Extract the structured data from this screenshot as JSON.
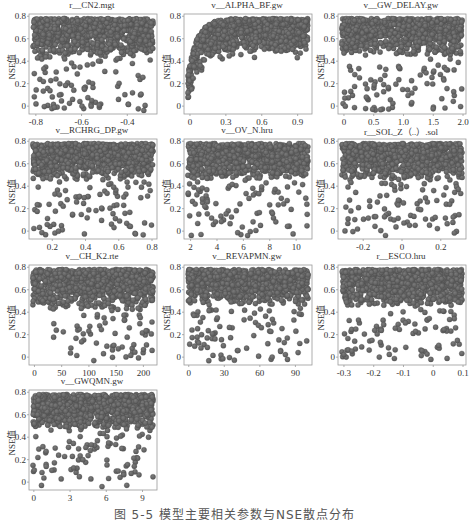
{
  "figure": {
    "caption": "图 5-5   模型主要相关参数与NSE散点分布",
    "ylabel": "NSE值",
    "dot_color": "#5a5a5a",
    "frame_color": "#9a9a9a",
    "text_color": "#333333"
  },
  "chart_data": [
    {
      "type": "scatter",
      "title": "r__CN2.mgt",
      "xlabel": "",
      "ylabel": "NSE值",
      "xlim": [
        -0.83,
        -0.27
      ],
      "ylim": [
        -0.07,
        0.82
      ],
      "xticks": [
        -0.8,
        -0.6,
        -0.4
      ],
      "xtick_labels": [
        "-0.8",
        "-0.6",
        "-0.4"
      ],
      "yticks": [
        0,
        0.2,
        0.4,
        0.6,
        0.8
      ],
      "ytick_labels": [
        "0",
        "0.2",
        "0.4",
        "0.6",
        "0.8"
      ],
      "pattern": "uniform",
      "dense_band": [
        0.42,
        0.78
      ]
    },
    {
      "type": "scatter",
      "title": "v__ALPHA_BF.gw",
      "xlabel": "",
      "ylabel": "NSE值",
      "xlim": [
        -0.05,
        1.02
      ],
      "ylim": [
        -0.07,
        0.82
      ],
      "xticks": [
        0,
        0.3,
        0.6,
        0.9
      ],
      "xtick_labels": [
        "0",
        "0.3",
        "0.6",
        "0.9"
      ],
      "yticks": [
        0,
        0.2,
        0.4,
        0.6,
        0.8
      ],
      "ytick_labels": [
        "0",
        "0.2",
        "0.4",
        "0.6",
        "0.8"
      ],
      "pattern": "saturating",
      "dense_band": [
        0.5,
        0.78
      ]
    },
    {
      "type": "scatter",
      "title": "v__GW_DELAY.gw",
      "xlabel": "",
      "ylabel": "NSE值",
      "xlim": [
        -0.1,
        2.05
      ],
      "ylim": [
        -0.07,
        0.82
      ],
      "xticks": [
        0,
        0.5,
        1.0,
        1.5,
        2.0
      ],
      "xtick_labels": [
        "0",
        "0.5",
        "1.0",
        "1.5",
        "2.0"
      ],
      "yticks": [
        0,
        0.2,
        0.4,
        0.6,
        0.8
      ],
      "ytick_labels": [
        "0",
        "0.2",
        "0.4",
        "0.6",
        "0.8"
      ],
      "pattern": "uniform",
      "dense_band": [
        0.45,
        0.78
      ]
    },
    {
      "type": "scatter",
      "title": "v__RCHRG_DP.gw",
      "xlabel": "",
      "ylabel": "NSE值",
      "xlim": [
        0.06,
        0.83
      ],
      "ylim": [
        -0.07,
        0.82
      ],
      "xticks": [
        0.2,
        0.4,
        0.6,
        0.8
      ],
      "xtick_labels": [
        "0.2",
        "0.4",
        "0.6",
        "0.8"
      ],
      "yticks": [
        0,
        0.2,
        0.4,
        0.6,
        0.8
      ],
      "ytick_labels": [
        "0",
        "0.2",
        "0.4",
        "0.6",
        "0.8"
      ],
      "pattern": "uniform",
      "dense_band": [
        0.45,
        0.78
      ]
    },
    {
      "type": "scatter",
      "title": "v__OV_N.hru",
      "xlabel": "",
      "ylabel": "NSE值",
      "xlim": [
        1.5,
        11.2
      ],
      "ylim": [
        -0.07,
        0.82
      ],
      "xticks": [
        2,
        4,
        6,
        8,
        10
      ],
      "xtick_labels": [
        "2",
        "4",
        "6",
        "8",
        "10"
      ],
      "yticks": [
        0,
        0.2,
        0.4,
        0.6,
        0.8
      ],
      "ytick_labels": [
        "0",
        "0.2",
        "0.4",
        "0.6",
        "0.8"
      ],
      "pattern": "uniform",
      "dense_band": [
        0.45,
        0.78
      ]
    },
    {
      "type": "scatter",
      "title": "r__SOL_Z（..）.sol",
      "xlabel": "",
      "ylabel": "NSE值",
      "xlim": [
        -0.33,
        0.33
      ],
      "ylim": [
        -0.07,
        0.82
      ],
      "xticks": [
        -0.2,
        0,
        0.2
      ],
      "xtick_labels": [
        "-0.2",
        "0",
        "0.2"
      ],
      "yticks": [
        0,
        0.2,
        0.4,
        0.6,
        0.8
      ],
      "ytick_labels": [
        "0",
        "0.2",
        "0.4",
        "0.6",
        "0.8"
      ],
      "pattern": "uniform",
      "dense_band": [
        0.45,
        0.78
      ]
    },
    {
      "type": "scatter",
      "title": "v__CH_K2.rte",
      "xlabel": "",
      "ylabel": "NSE值",
      "xlim": [
        -10,
        225
      ],
      "ylim": [
        -0.07,
        0.82
      ],
      "xticks": [
        0,
        50,
        100,
        150,
        200
      ],
      "xtick_labels": [
        "0",
        "50",
        "100",
        "150",
        "200"
      ],
      "yticks": [
        0,
        0.2,
        0.4,
        0.6,
        0.8
      ],
      "ytick_labels": [
        "0",
        "0.2",
        "0.4",
        "0.6",
        "0.8"
      ],
      "pattern": "increasing_spread",
      "dense_band": [
        0.42,
        0.78
      ]
    },
    {
      "type": "scatter",
      "title": "v__REVAPMN.gw",
      "xlabel": "",
      "ylabel": "NSE值",
      "xlim": [
        -4,
        104
      ],
      "ylim": [
        -0.07,
        0.82
      ],
      "xticks": [
        0,
        30,
        60,
        90
      ],
      "xtick_labels": [
        "0",
        "30",
        "60",
        "90"
      ],
      "yticks": [
        0,
        0.2,
        0.4,
        0.6,
        0.8
      ],
      "ytick_labels": [
        "0",
        "0.2",
        "0.4",
        "0.6",
        "0.8"
      ],
      "pattern": "uniform",
      "dense_band": [
        0.45,
        0.78
      ]
    },
    {
      "type": "scatter",
      "title": "r__ESCO.hru",
      "xlabel": "",
      "ylabel": "NSE值",
      "xlim": [
        -0.32,
        0.11
      ],
      "ylim": [
        -0.07,
        0.82
      ],
      "xticks": [
        -0.3,
        -0.2,
        -0.1,
        0,
        0.1
      ],
      "xtick_labels": [
        "-0.3",
        "-0.2",
        "-0.1",
        "0",
        "0.1"
      ],
      "yticks": [
        0,
        0.2,
        0.4,
        0.6,
        0.8
      ],
      "ytick_labels": [
        "0",
        "0.2",
        "0.4",
        "0.6",
        "0.8"
      ],
      "pattern": "uniform",
      "dense_band": [
        0.45,
        0.78
      ]
    },
    {
      "type": "scatter",
      "title": "v__GWQMN.gw",
      "xlabel": "",
      "ylabel": "NSE值",
      "xlim": [
        -0.4,
        10.2
      ],
      "ylim": [
        -0.07,
        0.82
      ],
      "xticks": [
        0,
        3,
        6,
        9
      ],
      "xtick_labels": [
        "0",
        "3",
        "6",
        "9"
      ],
      "yticks": [
        0,
        0.2,
        0.4,
        0.6,
        0.8
      ],
      "ytick_labels": [
        "0",
        "0.2",
        "0.4",
        "0.6",
        "0.8"
      ],
      "pattern": "uniform",
      "dense_band": [
        0.45,
        0.78
      ]
    }
  ]
}
